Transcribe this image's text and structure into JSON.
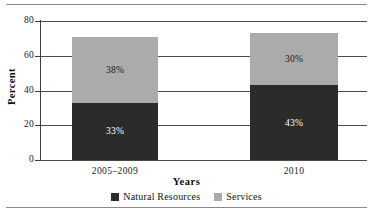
{
  "chart_data": {
    "type": "bar",
    "subtype": "stacked-bar",
    "title": "",
    "xlabel": "Years",
    "ylabel": "Percent",
    "categories": [
      "2005–2009",
      "2010"
    ],
    "series": [
      {
        "name": "Natural Resources",
        "color": "#2b2b2b",
        "values": [
          33,
          43
        ],
        "labels": [
          "33%",
          "43%"
        ]
      },
      {
        "name": "Services",
        "color": "#ababab",
        "values": [
          38,
          30
        ],
        "labels": [
          "38%",
          "30%"
        ]
      }
    ],
    "totals": [
      72,
      74
    ],
    "ylim": [
      0,
      80
    ],
    "yticks": [
      0,
      20,
      40,
      60,
      80
    ],
    "ytick_labels": [
      "0",
      "20",
      "40",
      "60",
      "80"
    ],
    "grid": true,
    "legend_position": "bottom"
  },
  "axes": {
    "y_title": "Percent",
    "x_title": "Years"
  },
  "legend": {
    "items": [
      {
        "label": "Natural Resources",
        "color": "#2b2b2b"
      },
      {
        "label": "Services",
        "color": "#ababab"
      }
    ]
  }
}
